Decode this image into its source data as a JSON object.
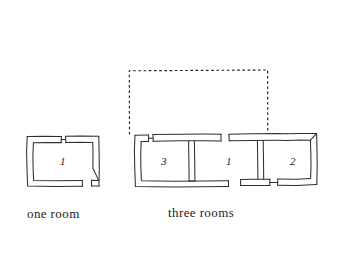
{
  "figure": {
    "background_color": "#ffffff",
    "ink_color": "#2b2b2b",
    "dashed_color": "#1f1f1f"
  },
  "captions": {
    "one_room": "one room",
    "three_rooms": "three rooms"
  },
  "plans": {
    "one_room": {
      "label": "one room",
      "rooms": [
        {
          "number": "1"
        }
      ]
    },
    "three_rooms": {
      "label": "three rooms",
      "rooms": [
        {
          "number": "3"
        },
        {
          "number": "1"
        },
        {
          "number": "2"
        }
      ]
    }
  },
  "overlay": {
    "name": "dashed-outline",
    "style": "dashed rectangle"
  }
}
